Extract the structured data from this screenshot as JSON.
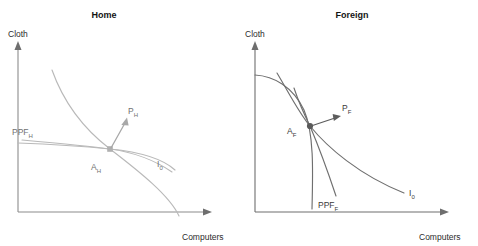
{
  "figure": {
    "panels": [
      {
        "id": "home",
        "title": "Home",
        "y_axis_label": "Cloth",
        "x_axis_label": "Computers",
        "ppf_label_base": "PPF",
        "ppf_label_sub": "H",
        "equilibrium_label_base": "A",
        "equilibrium_label_sub": "H",
        "price_label_base": "P",
        "price_label_sub": "H",
        "indifference_label_base": "I",
        "indifference_label_sub": "0",
        "line_color": "#b9b9b9",
        "text_color": "#707070"
      },
      {
        "id": "foreign",
        "title": "Foreign",
        "y_axis_label": "Cloth",
        "x_axis_label": "Computers",
        "ppf_label_base": "PPF",
        "ppf_label_sub": "F",
        "equilibrium_label_base": "A",
        "equilibrium_label_sub": "F",
        "price_label_base": "P",
        "price_label_sub": "F",
        "indifference_label_base": "I",
        "indifference_label_sub": "0",
        "line_color": "#6f6f6f",
        "text_color": "#3a3a3a"
      }
    ],
    "background_color": "#ffffff",
    "axis_color": "#6e6e6e"
  }
}
